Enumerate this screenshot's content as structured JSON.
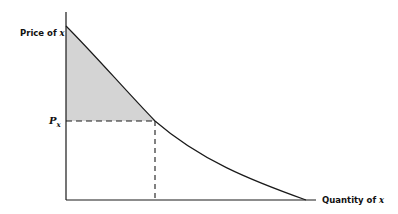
{
  "diagram": {
    "y_axis_label_prefix": "Price of ",
    "y_axis_label_var": "x",
    "x_axis_label_prefix": "Quantity of ",
    "x_axis_label_var": "x",
    "price_marker_main": "P",
    "price_marker_sub": "x",
    "shaded_region": "consumer surplus area above price Px under demand curve",
    "colors": {
      "line": "#1a1a1a",
      "shade": "#d4d4d4",
      "background": "#ffffff"
    }
  }
}
